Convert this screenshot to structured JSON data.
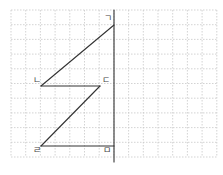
{
  "diagram": {
    "type": "grid-geometry",
    "grid": {
      "x0": 11,
      "y0": 10,
      "cell": 14.7,
      "cols": 14,
      "rows": 10,
      "color": "#c8c8c8",
      "style": "dashed"
    },
    "vertical_line": {
      "x": 114,
      "y_top": 10,
      "y_bottom": 162
    },
    "points": [
      {
        "label": "ㄱ",
        "x": 114,
        "y": 25,
        "label_x": 104,
        "label_y": 21
      },
      {
        "label": "ㄴ",
        "x": 41,
        "y": 86,
        "label_x": 33,
        "label_y": 83
      },
      {
        "label": "ㄷ",
        "x": 100,
        "y": 86,
        "label_x": 102,
        "label_y": 83
      },
      {
        "label": "ㄹ",
        "x": 41,
        "y": 146,
        "label_x": 33,
        "label_y": 153
      },
      {
        "label": "ㅁ",
        "x": 114,
        "y": 146,
        "label_x": 103,
        "label_y": 153
      }
    ],
    "segments": [
      {
        "from": "ㄱ",
        "to": "ㄴ"
      },
      {
        "from": "ㄴ",
        "to": "ㄷ"
      },
      {
        "from": "ㄷ",
        "to": "ㄹ"
      },
      {
        "from": "ㄹ",
        "to": "ㅁ"
      }
    ],
    "line_color": "#333333"
  }
}
